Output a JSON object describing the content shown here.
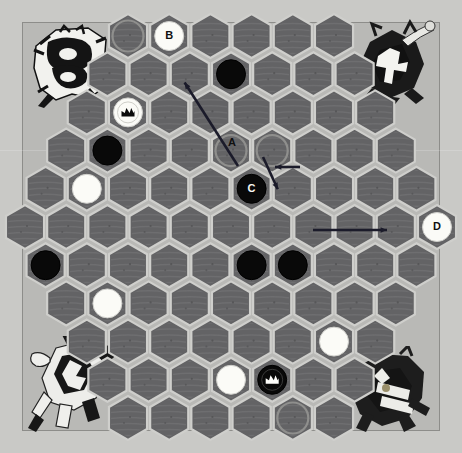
{
  "board": {
    "title": "Hexagonal checkers board",
    "background_color": "#c9c9c6",
    "frame_color": "#b9b9b6",
    "hex_fill_color": "#636365",
    "hex_border_color": "#cfcfcc",
    "rows": [
      6,
      7,
      8,
      9,
      10,
      11,
      10,
      9,
      8,
      7,
      6
    ],
    "row_count": 11,
    "hex_count": 91,
    "hex_width": 41,
    "hex_height": 38,
    "orientation": "pointy-top"
  },
  "pieces": [
    {
      "id": "p1",
      "color": "black",
      "king": false,
      "row": 1,
      "col": 3,
      "label": ""
    },
    {
      "id": "p2",
      "color": "white",
      "king": false,
      "row": 0,
      "col": 1,
      "label": "B"
    },
    {
      "id": "p3",
      "color": "white",
      "king": true,
      "row": 2,
      "col": 1,
      "label": ""
    },
    {
      "id": "p4",
      "color": "black",
      "king": false,
      "row": 3,
      "col": 1,
      "label": ""
    },
    {
      "id": "p5",
      "color": "black",
      "king": false,
      "row": 4,
      "col": 5,
      "label": "C"
    },
    {
      "id": "p6",
      "color": "white",
      "king": false,
      "row": 4,
      "col": 1,
      "label": ""
    },
    {
      "id": "p7",
      "color": "white",
      "king": false,
      "row": 5,
      "col": 10,
      "label": "D"
    },
    {
      "id": "p8",
      "color": "black",
      "king": false,
      "row": 6,
      "col": 0,
      "label": ""
    },
    {
      "id": "p9",
      "color": "black",
      "king": false,
      "row": 6,
      "col": 5,
      "label": ""
    },
    {
      "id": "p10",
      "color": "black",
      "king": false,
      "row": 6,
      "col": 6,
      "label": ""
    },
    {
      "id": "p11",
      "color": "white",
      "king": false,
      "row": 7,
      "col": 1,
      "label": ""
    },
    {
      "id": "p12",
      "color": "white",
      "king": false,
      "row": 8,
      "col": 6,
      "label": ""
    },
    {
      "id": "p13",
      "color": "white",
      "king": false,
      "row": 9,
      "col": 3,
      "label": ""
    },
    {
      "id": "p14",
      "color": "black",
      "king": true,
      "row": 9,
      "col": 4,
      "label": ""
    }
  ],
  "highlight_cells": [
    {
      "row": 0,
      "col": 0
    },
    {
      "row": 3,
      "col": 4
    },
    {
      "row": 3,
      "col": 5
    },
    {
      "row": 10,
      "col": 4
    }
  ],
  "annotations": [
    {
      "id": "A",
      "label": "A",
      "text_color": "#101010",
      "arrow_from": {
        "x": 300,
        "y": 167
      },
      "arrow_to": {
        "x": 272,
        "y": 167
      },
      "note": "A marks an empty destination hex, arrow points left"
    },
    {
      "id": "B",
      "label": "B",
      "text_color": "#101010",
      "arrow_from": {
        "x": 238,
        "y": 166
      },
      "arrow_to": {
        "x": 183,
        "y": 80
      },
      "note": "B marks a white piece at top, long diagonal arrow"
    },
    {
      "id": "C",
      "label": "C",
      "text_color": "#f7f7f4",
      "arrow_from": {
        "x": 263,
        "y": 157
      },
      "arrow_to": {
        "x": 279,
        "y": 192
      },
      "note": "C marks a black piece below A"
    },
    {
      "id": "D",
      "label": "D",
      "text_color": "#101010",
      "arrow_from": {
        "x": 313,
        "y": 230
      },
      "arrow_to": {
        "x": 390,
        "y": 230
      },
      "note": "D marks a white piece on the right edge"
    }
  ],
  "decorations": [
    {
      "id": "deco-top-left",
      "name": "heraldic-crest-light",
      "corner": "top-left",
      "tone": "light"
    },
    {
      "id": "deco-top-right",
      "name": "heraldic-knight-dark",
      "corner": "top-right",
      "tone": "dark"
    },
    {
      "id": "deco-bottom-left",
      "name": "heraldic-rider-light",
      "corner": "bottom-left",
      "tone": "light"
    },
    {
      "id": "deco-bottom-right",
      "name": "heraldic-crest-dark",
      "corner": "bottom-right",
      "tone": "dark"
    }
  ]
}
